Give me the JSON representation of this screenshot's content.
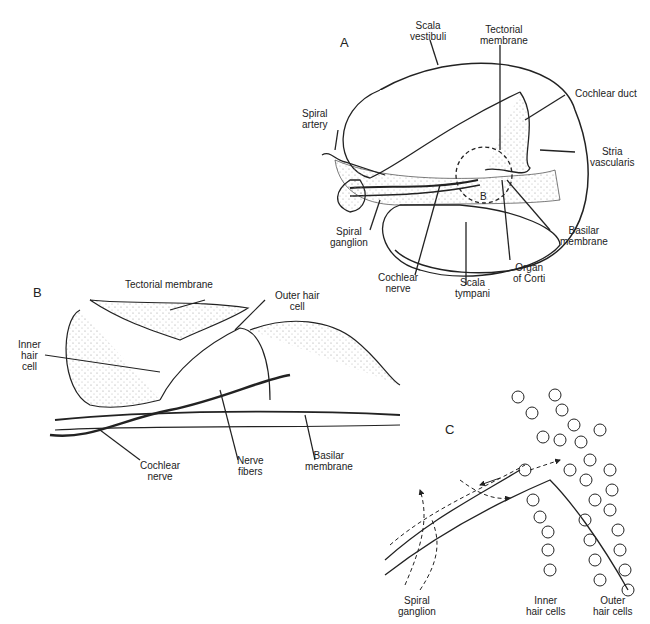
{
  "panels": {
    "A": {
      "letter": "A",
      "labels": {
        "scala_vestibuli": [
          "Scala",
          "vestibuli"
        ],
        "tectorial_membrane": [
          "Tectorial",
          "membrane"
        ],
        "cochlear_duct": "Cochlear duct",
        "spiral_artery": [
          "Spiral",
          "artery"
        ],
        "stria_vascularis": [
          "Stria",
          "vascularis"
        ],
        "b_marker": "B",
        "spiral_ganglion": [
          "Spiral",
          "ganglion"
        ],
        "basilar_membrane": [
          "Basilar",
          "membrane"
        ],
        "organ_of_corti": [
          "Organ",
          "of Corti"
        ],
        "cochlear_nerve": [
          "Cochlear",
          "nerve"
        ],
        "scala_tympani": [
          "Scala",
          "tympani"
        ]
      }
    },
    "B": {
      "letter": "B",
      "labels": {
        "tectorial_membrane": "Tectorial membrane",
        "outer_hair_cell": [
          "Outer hair",
          "cell"
        ],
        "inner_hair_cell": [
          "Inner",
          "hair",
          "cell"
        ],
        "cochlear_nerve": [
          "Cochlear",
          "nerve"
        ],
        "nerve_fibers": [
          "Nerve",
          "fibers"
        ],
        "basilar_membrane": [
          "Basilar",
          "membrane"
        ]
      }
    },
    "C": {
      "letter": "C",
      "labels": {
        "spiral_ganglion": [
          "Spiral",
          "ganglion"
        ],
        "inner_hair_cells": [
          "Inner",
          "hair cells"
        ],
        "outer_hair_cells": [
          "Outer",
          "hair cells"
        ]
      }
    }
  },
  "colors": {
    "ink": "#222222",
    "stipple": "#999999",
    "background": "#ffffff"
  }
}
